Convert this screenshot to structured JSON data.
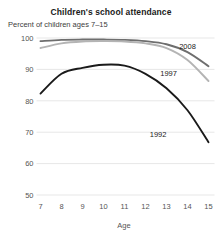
{
  "chart_data": {
    "type": "line",
    "title": "Children's school attendance",
    "subtitle": "Percent of children ages 7–15",
    "xlabel": "Age",
    "ylabel": "",
    "x": [
      7,
      8,
      9,
      10,
      11,
      12,
      13,
      14,
      15
    ],
    "xticklabels": [
      "7",
      "8",
      "9",
      "10",
      "11",
      "12",
      "13",
      "14",
      "15"
    ],
    "yticklabels": [
      "100",
      "90",
      "80",
      "70",
      "60",
      "50"
    ],
    "yticks": [
      100,
      90,
      80,
      70,
      60,
      50
    ],
    "xlim": [
      7,
      15
    ],
    "ylim": [
      50,
      100
    ],
    "grid": true,
    "legend_position": "inline-right",
    "series": [
      {
        "name": "2008",
        "color": "#6e6e6e",
        "values": [
          99.0,
          99.4,
          99.5,
          99.5,
          99.4,
          99.0,
          98.0,
          95.5,
          91.0
        ],
        "label_x": 14.0,
        "label_y": 96.5
      },
      {
        "name": "1997",
        "color": "#b4b4b4",
        "values": [
          96.8,
          98.3,
          98.9,
          99.0,
          98.9,
          98.3,
          96.8,
          93.0,
          86.3
        ],
        "label_x": 13.1,
        "label_y": 88.0
      },
      {
        "name": "1992",
        "color": "#1a1a1a",
        "values": [
          82.3,
          88.6,
          90.5,
          91.5,
          91.2,
          88.6,
          84.0,
          77.0,
          66.8
        ],
        "label_x": 12.6,
        "label_y": 68.5
      }
    ]
  }
}
